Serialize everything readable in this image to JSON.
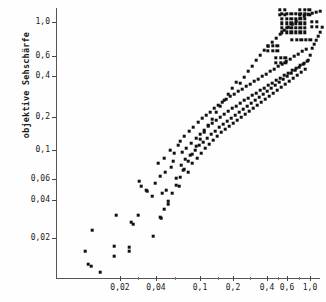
{
  "chart_data": {
    "type": "scatter",
    "title": "",
    "xlabel": "",
    "ylabel": "objektive Sehschärfe",
    "xscale": "log",
    "yscale": "log",
    "grid": false,
    "legend": null,
    "xticks": [
      {
        "label": "0,02",
        "value": 0.02,
        "px": 120
      },
      {
        "label": "0,04",
        "value": 0.04,
        "px": 156
      },
      {
        "label": "0,1",
        "value": 0.1,
        "px": 200
      },
      {
        "label": "0,2",
        "value": 0.2,
        "px": 233
      },
      {
        "label": "0,4",
        "value": 0.4,
        "px": 267
      },
      {
        "label": "0,6",
        "value": 0.6,
        "px": 287
      },
      {
        "label": "1,0",
        "value": 1.0,
        "px": 310
      }
    ],
    "xminorticks_px": [
      138,
      175,
      218,
      250,
      278,
      299
    ],
    "yticks": [
      {
        "label": "1,0",
        "value": 1.0,
        "px": 22
      },
      {
        "label": "0,6",
        "value": 0.6,
        "px": 56
      },
      {
        "label": "0,4",
        "value": 0.4,
        "px": 76
      },
      {
        "label": "0,2",
        "value": 0.2,
        "px": 117
      },
      {
        "label": "0,1",
        "value": 0.1,
        "px": 150
      },
      {
        "label": "0,06",
        "value": 0.06,
        "px": 179
      },
      {
        "label": "0,04",
        "value": 0.04,
        "px": 200
      },
      {
        "label": "0,02",
        "value": 0.02,
        "px": 238
      }
    ],
    "xlim": [
      0.012,
      1.25
    ],
    "ylim": [
      0.013,
      1.25
    ],
    "n_points": 218,
    "points_px": [
      [
        85,
        251
      ],
      [
        88,
        264
      ],
      [
        91,
        266
      ],
      [
        92,
        230
      ],
      [
        100,
        272
      ],
      [
        114,
        246
      ],
      [
        114,
        256
      ],
      [
        116,
        215
      ],
      [
        129,
        247
      ],
      [
        129,
        251
      ],
      [
        131,
        222
      ],
      [
        133,
        224
      ],
      [
        138,
        215
      ],
      [
        139,
        181
      ],
      [
        141,
        186
      ],
      [
        146,
        190
      ],
      [
        147,
        191
      ],
      [
        152,
        196
      ],
      [
        153,
        236
      ],
      [
        155,
        183
      ],
      [
        158,
        163
      ],
      [
        160,
        176
      ],
      [
        161,
        218
      ],
      [
        162,
        193
      ],
      [
        164,
        158
      ],
      [
        165,
        172
      ],
      [
        166,
        190
      ],
      [
        168,
        204
      ],
      [
        170,
        150
      ],
      [
        171,
        167
      ],
      [
        173,
        161
      ],
      [
        174,
        153
      ],
      [
        176,
        178
      ],
      [
        178,
        145
      ],
      [
        179,
        186
      ],
      [
        180,
        141
      ],
      [
        181,
        165
      ],
      [
        182,
        152
      ],
      [
        183,
        170
      ],
      [
        184,
        136
      ],
      [
        185,
        159
      ],
      [
        186,
        148
      ],
      [
        188,
        172
      ],
      [
        189,
        131
      ],
      [
        190,
        155
      ],
      [
        191,
        143
      ],
      [
        192,
        163
      ],
      [
        193,
        127
      ],
      [
        195,
        150
      ],
      [
        196,
        138
      ],
      [
        197,
        158
      ],
      [
        198,
        122
      ],
      [
        199,
        145
      ],
      [
        200,
        134
      ],
      [
        201,
        153
      ],
      [
        202,
        118
      ],
      [
        203,
        142
      ],
      [
        204,
        130
      ],
      [
        205,
        148
      ],
      [
        206,
        115
      ],
      [
        207,
        138
      ],
      [
        208,
        126
      ],
      [
        209,
        144
      ],
      [
        210,
        112
      ],
      [
        211,
        134
      ],
      [
        212,
        123
      ],
      [
        213,
        140
      ],
      [
        214,
        108
      ],
      [
        215,
        131
      ],
      [
        216,
        120
      ],
      [
        217,
        136
      ],
      [
        218,
        105
      ],
      [
        219,
        127
      ],
      [
        220,
        117
      ],
      [
        221,
        132
      ],
      [
        222,
        102
      ],
      [
        223,
        124
      ],
      [
        224,
        114
      ],
      [
        225,
        129
      ],
      [
        226,
        99
      ],
      [
        227,
        121
      ],
      [
        228,
        111
      ],
      [
        229,
        126
      ],
      [
        230,
        96
      ],
      [
        231,
        118
      ],
      [
        232,
        108
      ],
      [
        233,
        123
      ],
      [
        234,
        94
      ],
      [
        235,
        115
      ],
      [
        236,
        106
      ],
      [
        237,
        120
      ],
      [
        238,
        91
      ],
      [
        239,
        112
      ],
      [
        240,
        103
      ],
      [
        241,
        117
      ],
      [
        242,
        89
      ],
      [
        243,
        109
      ],
      [
        244,
        100
      ],
      [
        245,
        114
      ],
      [
        246,
        86
      ],
      [
        247,
        106
      ],
      [
        248,
        98
      ],
      [
        249,
        111
      ],
      [
        250,
        84
      ],
      [
        251,
        103
      ],
      [
        252,
        95
      ],
      [
        253,
        108
      ],
      [
        254,
        81
      ],
      [
        255,
        100
      ],
      [
        256,
        93
      ],
      [
        257,
        105
      ],
      [
        258,
        79
      ],
      [
        259,
        97
      ],
      [
        260,
        90
      ],
      [
        261,
        102
      ],
      [
        262,
        76
      ],
      [
        263,
        94
      ],
      [
        264,
        88
      ],
      [
        265,
        99
      ],
      [
        266,
        74
      ],
      [
        267,
        91
      ],
      [
        268,
        85
      ],
      [
        269,
        96
      ],
      [
        270,
        71
      ],
      [
        271,
        88
      ],
      [
        272,
        83
      ],
      [
        273,
        93
      ],
      [
        274,
        69
      ],
      [
        275,
        85
      ],
      [
        276,
        80
      ],
      [
        277,
        90
      ],
      [
        278,
        66
      ],
      [
        279,
        82
      ],
      [
        280,
        78
      ],
      [
        281,
        87
      ],
      [
        282,
        64
      ],
      [
        283,
        79
      ],
      [
        284,
        75
      ],
      [
        285,
        84
      ],
      [
        286,
        61
      ],
      [
        287,
        76
      ],
      [
        288,
        73
      ],
      [
        289,
        81
      ],
      [
        290,
        59
      ],
      [
        291,
        73
      ],
      [
        292,
        70
      ],
      [
        293,
        78
      ],
      [
        294,
        56
      ],
      [
        295,
        70
      ],
      [
        296,
        68
      ],
      [
        297,
        75
      ],
      [
        298,
        54
      ],
      [
        299,
        67
      ],
      [
        300,
        65
      ],
      [
        301,
        72
      ],
      [
        302,
        51
      ],
      [
        303,
        64
      ],
      [
        304,
        63
      ],
      [
        305,
        69
      ],
      [
        306,
        49
      ],
      [
        307,
        61
      ],
      [
        308,
        60
      ],
      [
        310,
        55
      ],
      [
        312,
        48
      ],
      [
        314,
        44
      ],
      [
        316,
        40
      ],
      [
        318,
        36
      ],
      [
        320,
        32
      ],
      [
        322,
        27
      ],
      [
        240,
        83
      ],
      [
        244,
        77
      ],
      [
        248,
        71
      ],
      [
        252,
        66
      ],
      [
        256,
        60
      ],
      [
        260,
        55
      ],
      [
        264,
        50
      ],
      [
        268,
        46
      ],
      [
        272,
        42
      ],
      [
        276,
        38
      ],
      [
        280,
        34
      ],
      [
        284,
        30
      ],
      [
        288,
        27
      ],
      [
        292,
        24
      ],
      [
        296,
        21
      ],
      [
        300,
        18
      ],
      [
        304,
        16
      ],
      [
        308,
        14
      ],
      [
        312,
        13
      ],
      [
        316,
        12
      ],
      [
        320,
        11
      ],
      [
        232,
        88
      ],
      [
        236,
        82
      ],
      [
        228,
        94
      ],
      [
        224,
        100
      ],
      [
        220,
        106
      ],
      [
        216,
        112
      ],
      [
        212,
        119
      ],
      [
        208,
        125
      ],
      [
        204,
        132
      ],
      [
        200,
        139
      ],
      [
        196,
        146
      ],
      [
        192,
        154
      ],
      [
        188,
        161
      ],
      [
        184,
        169
      ],
      [
        180,
        177
      ],
      [
        176,
        185
      ],
      [
        172,
        193
      ],
      [
        168,
        201
      ],
      [
        164,
        209
      ],
      [
        160,
        217
      ]
    ],
    "dense_block": {
      "x_px": 282,
      "y_px": 14,
      "width_px": 28,
      "height_px": 22,
      "cell_px": 3.4,
      "gap_px": 1.2,
      "note": "saturated overlapping points at high acuity"
    },
    "satellite_blocks": [
      {
        "x_px": 280,
        "y_px": 10,
        "cols": 2,
        "rows": 2
      },
      {
        "x_px": 300,
        "y_px": 10,
        "cols": 3,
        "rows": 2
      },
      {
        "x_px": 312,
        "y_px": 22,
        "cols": 2,
        "rows": 2
      },
      {
        "x_px": 292,
        "y_px": 40,
        "cols": 5,
        "rows": 1
      },
      {
        "x_px": 268,
        "y_px": 46,
        "cols": 3,
        "rows": 2
      },
      {
        "x_px": 276,
        "y_px": 58,
        "cols": 3,
        "rows": 2
      }
    ]
  }
}
